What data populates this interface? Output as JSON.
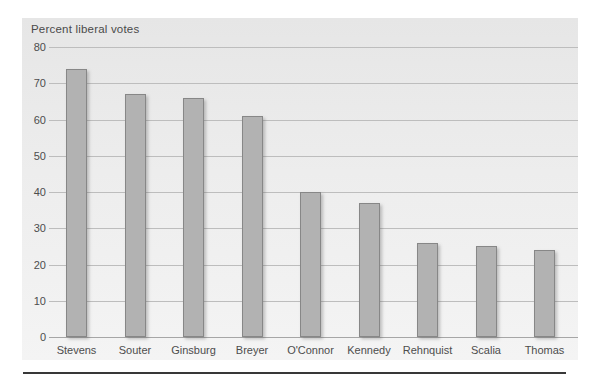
{
  "chart": {
    "panel_bg_top": "#e6e6e6",
    "panel_bg_bottom": "#f4f4f4",
    "bar_fill": "#b2b2b2",
    "bar_border": "#878787",
    "gridline_color": "#bdbdbd",
    "baseline_color": "#a6a6a6",
    "axis_text_color": "#4d4d4d",
    "separator_color": "#383838"
  },
  "chart_data": {
    "type": "bar",
    "title": "Percent liberal votes",
    "categories": [
      "Stevens",
      "Souter",
      "Ginsburg",
      "Breyer",
      "O'Connor",
      "Kennedy",
      "Rehnquist",
      "Scalia",
      "Thomas"
    ],
    "values": [
      74,
      67,
      66,
      61,
      40,
      37,
      26,
      25,
      24
    ],
    "xlabel": "",
    "ylabel": "Percent liberal votes",
    "ylim": [
      0,
      80
    ],
    "yticks": [
      0,
      10,
      20,
      30,
      40,
      50,
      60,
      70,
      80
    ],
    "grid": true,
    "legend": false
  }
}
